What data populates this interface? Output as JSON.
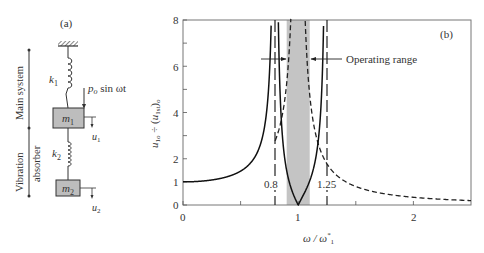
{
  "panel_a": {
    "label": "(a)",
    "brace_main": "Main system",
    "brace_absorber_1": "Vibration",
    "brace_absorber_2": "absorber",
    "spring1": "k",
    "spring1_sub": "1",
    "spring2": "k",
    "spring2_sub": "2",
    "mass1": "m",
    "mass1_sub": "1",
    "mass2": "m",
    "mass2_sub": "2",
    "force": "p",
    "force_sub": "o",
    "force_rest": " sin ωt",
    "disp1": "u",
    "disp1_sub": "1",
    "disp2": "u",
    "disp2_sub": "2",
    "colors": {
      "mass_fill": "#bdbdbd",
      "line": "#2b2b2b"
    }
  },
  "panel_b": {
    "label": "(b)",
    "annotation": "Operating range",
    "marker_low": "0.8",
    "marker_high": "1.25",
    "shade_color": "#c4c4c4"
  },
  "chart_data": {
    "type": "line",
    "title": "",
    "xlabel": "ω / ω*₁",
    "ylabel": "u₁ₒ ÷ (u₁ₛₜ)ₒ",
    "xlim": [
      0,
      2.5
    ],
    "ylim": [
      0,
      8
    ],
    "x_ticks": [
      0,
      1,
      2
    ],
    "x_minor_ticks": [
      0.5,
      1.5
    ],
    "y_ticks": [
      0,
      1,
      2,
      4,
      6,
      8
    ],
    "y_minor_ticks": [
      3,
      5,
      7
    ],
    "grid": false,
    "shaded_region": {
      "x": [
        0.9,
        1.1
      ],
      "label": "Operating range"
    },
    "vertical_markers": [
      {
        "x": 0.8,
        "label": "0.8",
        "style": "long-dash"
      },
      {
        "x": 1.25,
        "label": "1.25",
        "style": "long-dash"
      }
    ],
    "series": [
      {
        "name": "with absorber",
        "style": "solid",
        "description": "|1-r²| / |(1+μ-r²)(1-r²)-μ|, resonances at ~0.8 and ~1.25, zero at r=1"
      },
      {
        "name": "without absorber",
        "style": "dashed",
        "description": "1/|1-r²|, resonance at r=1"
      }
    ]
  }
}
